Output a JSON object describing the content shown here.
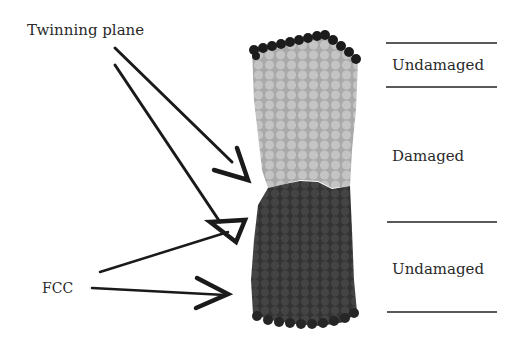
{
  "figure": {
    "labels": {
      "twinning_plane": "Twinning plane",
      "fcc": "FCC",
      "region_top": "Undamaged",
      "region_middle": "Damaged",
      "region_bottom": "Undamaged"
    },
    "regions": [
      {
        "name": "Undamaged",
        "position": "top",
        "color": "#b3b3b3"
      },
      {
        "name": "Damaged",
        "position": "middle",
        "color": "#b3b3b3"
      },
      {
        "name": "Undamaged",
        "position": "bottom",
        "color": "#3a3a3a"
      }
    ],
    "colors": {
      "surface_atoms": "#1e1e1e",
      "twinned_atoms": "#b8b8b8",
      "fcc_atoms": "#3b3b3b",
      "arrows": "#1a1a1a",
      "divider_lines": "#222222"
    }
  }
}
